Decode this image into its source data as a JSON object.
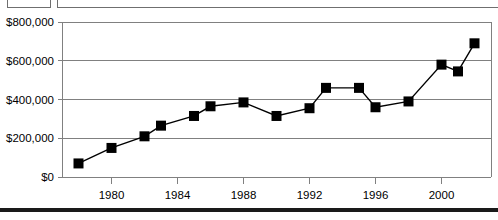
{
  "chart_data": {
    "type": "line",
    "title": "",
    "subtitle": "",
    "xlabel": "",
    "ylabel": "",
    "xlim": [
      1977,
      2003
    ],
    "ylim": [
      0,
      800000
    ],
    "grid": true,
    "legend_position": "none",
    "marker": "filled-square",
    "y_tick_labels": [
      "$0",
      "$200,000",
      "$400,000",
      "$600,000",
      "$800,000"
    ],
    "y_ticks": [
      0,
      200000,
      400000,
      600000,
      800000
    ],
    "x_tick_labels": [
      "1980",
      "1984",
      "1988",
      "1992",
      "1996",
      "2000"
    ],
    "x_ticks": [
      1980,
      1984,
      1988,
      1992,
      1996,
      2000
    ],
    "x": [
      1978,
      1980,
      1982,
      1983,
      1984,
      1986,
      1987,
      1988,
      1989,
      1990,
      1991,
      1992,
      1993,
      1994,
      1995,
      1996,
      1997,
      1998,
      1999,
      2000,
      2001,
      2002
    ],
    "values": [
      70000,
      150000,
      210000,
      265000,
      265000,
      315000,
      365000,
      385000,
      385000,
      315000,
      315000,
      355000,
      460000,
      460000,
      460000,
      360000,
      360000,
      390000,
      580000,
      580000,
      545000,
      690000
    ],
    "series": [
      {
        "name": "Value",
        "points": [
          {
            "x": 1978,
            "y": 70000
          },
          {
            "x": 1980,
            "y": 150000
          },
          {
            "x": 1982,
            "y": 210000
          },
          {
            "x": 1983,
            "y": 265000
          },
          {
            "x": 1985,
            "y": 315000
          },
          {
            "x": 1986,
            "y": 365000
          },
          {
            "x": 1988,
            "y": 385000
          },
          {
            "x": 1990,
            "y": 315000
          },
          {
            "x": 1992,
            "y": 355000
          },
          {
            "x": 1993,
            "y": 460000
          },
          {
            "x": 1995,
            "y": 460000
          },
          {
            "x": 1996,
            "y": 360000
          },
          {
            "x": 1998,
            "y": 390000
          },
          {
            "x": 2000,
            "y": 580000
          },
          {
            "x": 2001,
            "y": 545000
          },
          {
            "x": 2002,
            "y": 690000
          }
        ]
      }
    ],
    "colors": {
      "line": "#000000",
      "marker": "#000000",
      "grid": "#808080",
      "axis": "#808080",
      "background": "#ffffff"
    }
  },
  "top_strip": {
    "note": ""
  }
}
